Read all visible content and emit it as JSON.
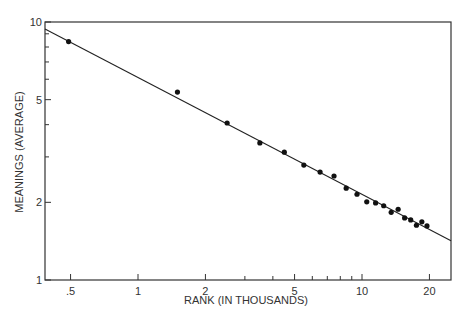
{
  "chart_data": {
    "type": "scatter",
    "title": "",
    "xlabel": "RANK (IN THOUSANDS)",
    "ylabel": "MEANINGS (AVERAGE)",
    "xscale": "log",
    "yscale": "log",
    "xlim": [
      0.4,
      26
    ],
    "ylim": [
      1,
      10
    ],
    "grid": false,
    "legend": null,
    "x_ticks": [
      {
        "value": 0.5,
        "label": ".5"
      },
      {
        "value": 1,
        "label": "1"
      },
      {
        "value": 2,
        "label": "2"
      },
      {
        "value": 5,
        "label": "5"
      },
      {
        "value": 10,
        "label": "10"
      },
      {
        "value": 20,
        "label": "20"
      }
    ],
    "x_minor_ticks": [
      3,
      4,
      6,
      7,
      8,
      9
    ],
    "y_ticks": [
      {
        "value": 1,
        "label": "1"
      },
      {
        "value": 2,
        "label": "2"
      },
      {
        "value": 5,
        "label": "5"
      },
      {
        "value": 10,
        "label": "10"
      }
    ],
    "y_minor_ticks": [
      3,
      4,
      6,
      7,
      8,
      9
    ],
    "series": [
      {
        "name": "observed",
        "style": "dots",
        "x": [
          0.49,
          1.5,
          2.5,
          3.5,
          4.5,
          5.5,
          6.5,
          7.5,
          8.5,
          9.5,
          10.5,
          11.5,
          12.5,
          13.5,
          14.5,
          15.5,
          16.5,
          17.5,
          18.5,
          19.5
        ],
        "y": [
          8.4,
          5.35,
          4.06,
          3.4,
          3.13,
          2.79,
          2.62,
          2.53,
          2.27,
          2.15,
          2.01,
          1.99,
          1.94,
          1.83,
          1.88,
          1.74,
          1.71,
          1.63,
          1.68,
          1.62
        ]
      },
      {
        "name": "fit",
        "style": "line",
        "x": [
          0.4,
          26
        ],
        "y": [
          9.4,
          1.42
        ]
      }
    ]
  }
}
